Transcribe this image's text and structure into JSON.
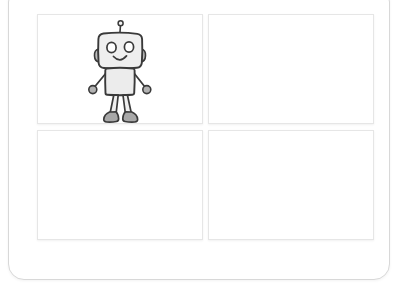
{
  "canvas": {
    "width": 402,
    "height": 293,
    "background_color": "#ffffff"
  },
  "card": {
    "name": "rounded-card",
    "background_color": "#ffffff",
    "border_color": "#d8d8d8",
    "corner_radius_px": 16
  },
  "grid": {
    "rows": 2,
    "columns": 2,
    "panel_background_color": "#ffffff",
    "panel_border_color": "#e6e6e6",
    "panels": [
      {
        "id": "panel-top-left",
        "position": "top-left",
        "content": "robot-illustration",
        "empty": false
      },
      {
        "id": "panel-top-right",
        "position": "top-right",
        "content": "",
        "empty": true
      },
      {
        "id": "panel-bottom-left",
        "position": "bottom-left",
        "content": "",
        "empty": true
      },
      {
        "id": "panel-bottom-right",
        "position": "bottom-right",
        "content": "",
        "empty": true
      }
    ]
  },
  "illustration": {
    "name": "robot-illustration",
    "style": "hand-drawn sketch",
    "stroke_color": "#3a3a3a",
    "body_fill_color": "#f0f0f0",
    "accent_fill_color": "#a8a8a8",
    "parts": [
      "antenna",
      "head",
      "left-ear",
      "right-ear",
      "left-eye",
      "right-eye",
      "mouth-smile",
      "torso",
      "left-arm",
      "right-arm",
      "left-hand",
      "right-hand",
      "left-leg",
      "right-leg",
      "left-foot",
      "right-foot"
    ]
  }
}
